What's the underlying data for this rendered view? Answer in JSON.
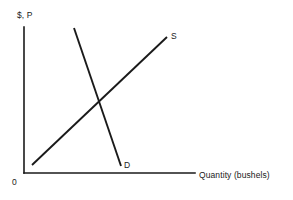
{
  "figure": {
    "background_color": "#ffffff",
    "line_color": "#1a1a1a",
    "width": 293,
    "height": 200
  },
  "labels": {
    "y_axis": "$, P",
    "x_axis": "Quantity (bushels)",
    "origin": "0",
    "supply": "S",
    "demand": "D"
  },
  "chart_data": {
    "type": "line",
    "title": "",
    "subtitle": "",
    "xlabel": "Quantity (bushels)",
    "ylabel": "$, P",
    "grid": false,
    "legend_position": "inline-endpoint",
    "axis_origin_label": "0",
    "xlim": [
      0,
      100
    ],
    "ylim": [
      0,
      100
    ],
    "xticks": [],
    "yticks": [],
    "xticklabels": [],
    "yticklabels": [],
    "annotations": [
      {
        "text": "S",
        "x": 83,
        "y": 93
      },
      {
        "text": "D",
        "x": 56,
        "y": 6
      },
      {
        "text": "0",
        "x": 0,
        "y": 0
      }
    ],
    "series": [
      {
        "name": "S",
        "label": "S",
        "description": "Supply curve, upward sloping",
        "color": "#1a1a1a",
        "x": [
          5,
          83
        ],
        "y": [
          6,
          93
        ]
      },
      {
        "name": "D",
        "label": "D",
        "description": "Demand curve, downward sloping",
        "color": "#1a1a1a",
        "x": [
          29,
          56
        ],
        "y": [
          99,
          5
        ]
      }
    ],
    "equilibrium": {
      "x": 43,
      "y": 48
    }
  },
  "geometry": {
    "y_axis": {
      "x1": 24,
      "y1": 27,
      "x2": 24,
      "y2": 173
    },
    "x_axis": {
      "x1": 24,
      "y1": 173,
      "x2": 195,
      "y2": 173
    },
    "supply": {
      "x1": 32,
      "y1": 165,
      "x2": 167,
      "y2": 37
    },
    "demand": {
      "x1": 74,
      "y1": 28,
      "x2": 121,
      "y2": 166
    }
  }
}
